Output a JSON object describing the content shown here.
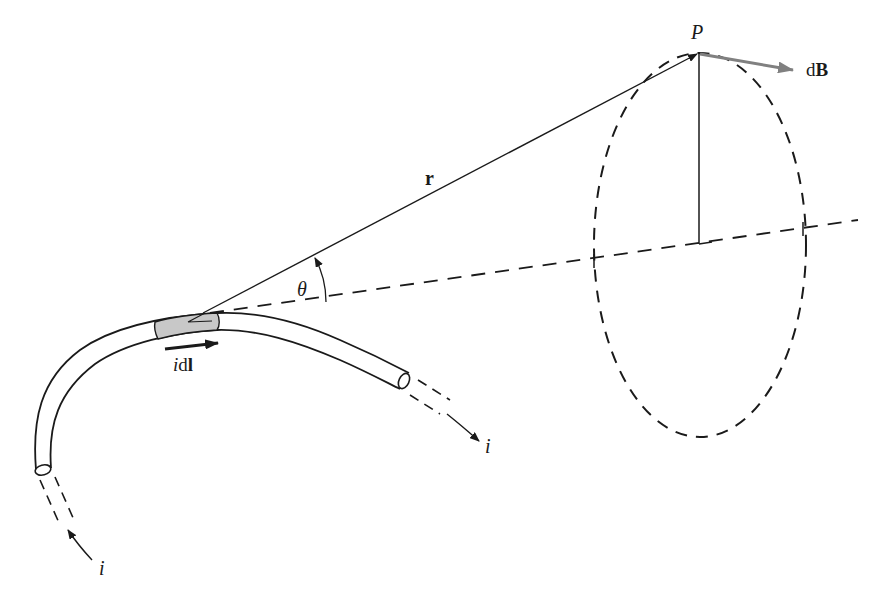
{
  "figure": {
    "labels": {
      "point": "P",
      "field_d": "d",
      "field_B": "B",
      "radius_vector": "r",
      "angle": "θ",
      "element_i": "i",
      "element_dl_d": "d",
      "element_dl_l": "l",
      "current_out": "i",
      "current_in": "i"
    },
    "colors": {
      "line": "#1a1a1a",
      "dB_arrow": "#808080",
      "element_fill": "#c8c8c8",
      "background": "#ffffff"
    }
  }
}
